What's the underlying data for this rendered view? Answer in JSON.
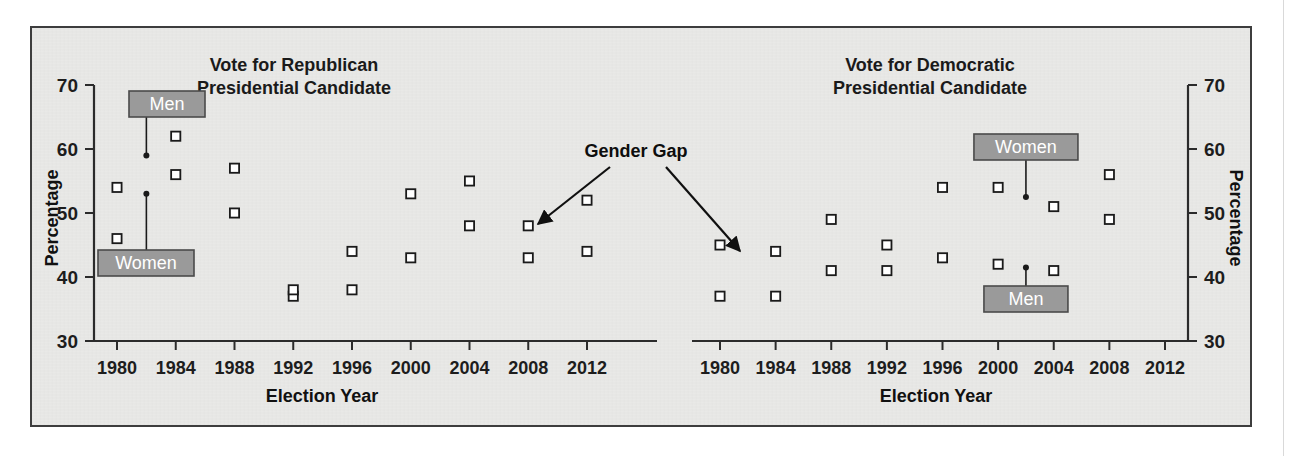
{
  "figure": {
    "background_color": "#e9e9e7",
    "border_color": "#3d3d3d"
  },
  "axis": {
    "y_title": "Percentage",
    "x_title": "Election Year",
    "y_ticks": [
      "70",
      "60",
      "50",
      "40",
      "30"
    ],
    "y_min": 30,
    "y_max": 70,
    "x_ticks": [
      "1980",
      "1984",
      "1988",
      "1992",
      "1996",
      "2000",
      "2004",
      "2008",
      "2012"
    ]
  },
  "annotation": {
    "gender_gap_label": "Gender Gap"
  },
  "legend": {
    "men_label": "Men",
    "women_label": "Women",
    "men_color": "#9e9e9e",
    "women_color": "#c6c6c6",
    "box_fill": "#9a9a9a",
    "box_text_color": "#ffffff"
  },
  "chart_data": [
    {
      "id": "republican",
      "type": "line",
      "title": "Vote for Republican\nPresidential Candidate",
      "title_line1": "Vote for Republican",
      "title_line2": "Presidential Candidate",
      "xlabel": "Election Year",
      "ylabel": "Percentage",
      "ylim": [
        30,
        70
      ],
      "grid": false,
      "legend_position": "inline-callout",
      "categories": [
        "1980",
        "1984",
        "1988",
        "1992",
        "1996",
        "2000",
        "2004",
        "2008",
        "2012"
      ],
      "series": [
        {
          "name": "Men",
          "color": "#9e9e9e",
          "values": [
            54,
            62,
            57,
            38,
            44,
            53,
            55,
            48,
            52
          ]
        },
        {
          "name": "Women",
          "color": "#c6c6c6",
          "values": [
            46,
            56,
            50,
            37,
            38,
            43,
            48,
            43,
            44
          ]
        }
      ]
    },
    {
      "id": "democratic",
      "type": "line",
      "title": "Vote for Democratic\nPresidential Candidate",
      "title_line1": "Vote for Democratic",
      "title_line2": "Presidential Candidate",
      "xlabel": "Election Year",
      "ylabel": "Percentage",
      "ylim": [
        30,
        70
      ],
      "grid": false,
      "legend_position": "inline-callout",
      "categories": [
        "1980",
        "1984",
        "1988",
        "1992",
        "1996",
        "2000",
        "2004",
        "2008",
        "2012"
      ],
      "series": [
        {
          "name": "Women",
          "color": "#c6c6c6",
          "values": [
            45,
            44,
            49,
            45,
            54,
            54,
            51,
            56,
            55
          ]
        },
        {
          "name": "Men",
          "color": "#9e9e9e",
          "values": [
            37,
            37,
            41,
            41,
            43,
            42,
            41,
            49,
            45
          ]
        }
      ]
    }
  ]
}
